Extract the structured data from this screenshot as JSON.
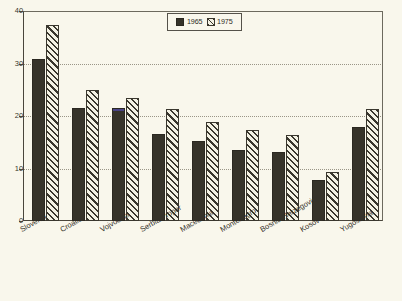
{
  "chart_data": {
    "type": "bar",
    "title": "",
    "subtitle": "",
    "xlabel": "",
    "ylabel": "",
    "ylim": [
      0,
      40
    ],
    "yticks": [
      0,
      10,
      20,
      30,
      40
    ],
    "ytick_labels": [
      "0",
      "10",
      "20",
      "30",
      "40"
    ],
    "grid": true,
    "grid_values": [
      10,
      20,
      30
    ],
    "legend_position": "top-center",
    "categories": [
      "Slovenia",
      "Croatia",
      "Vojvodina",
      "Serbia Proper",
      "Macedonia",
      "Montenegro",
      "Bosnia-Herzegovina",
      "Kosovo",
      "Yugoslavia"
    ],
    "series": [
      {
        "name": "1965",
        "style": "solid",
        "color": "#36332a",
        "values": [
          30.8,
          21.5,
          21.6,
          16.6,
          15.3,
          13.6,
          13.2,
          7.8,
          17.9
        ]
      },
      {
        "name": "1975",
        "style": "hatch",
        "color": "#3a372e",
        "values": [
          37.3,
          25.0,
          23.5,
          21.3,
          18.8,
          17.3,
          16.4,
          9.3,
          21.3
        ]
      }
    ],
    "annotations": [
      {
        "name": "vojvodina-1965-blue-cap",
        "category": "Vojvodina",
        "series": "1965",
        "color": "#4a4486"
      }
    ]
  },
  "legend": {
    "entries": [
      {
        "label": "1965",
        "swatch": "solid-square-icon"
      },
      {
        "label": "1975",
        "swatch": "hatched-square-icon"
      }
    ]
  },
  "colors": {
    "background": "#f9f7ec",
    "axis": "#4a463c",
    "grid": "#9a9687",
    "series_1965": "#36332a",
    "series_1975": "#3a372e",
    "accent_blue": "#4a4486"
  }
}
